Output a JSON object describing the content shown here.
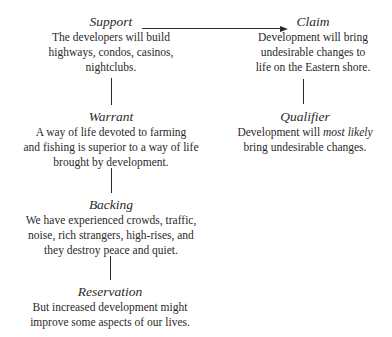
{
  "diagram": {
    "type": "toulmin-argument-model",
    "nodes": {
      "support": {
        "title": "Support",
        "lines": [
          "The developers will build",
          "highways, condos, casinos,",
          "nightclubs."
        ]
      },
      "claim": {
        "title": "Claim",
        "lines": [
          "Development will bring",
          "undesirable changes to",
          "life on the Eastern shore."
        ]
      },
      "warrant": {
        "title": "Warrant",
        "lines": [
          "A way of life devoted to farming",
          "and fishing is superior to a way of life",
          "brought by development."
        ]
      },
      "qualifier": {
        "title": "Qualifier",
        "line1_pre": "Development will ",
        "line1_emph": "most likely",
        "line2": "bring undesirable changes."
      },
      "backing": {
        "title": "Backing",
        "lines": [
          "We have experienced crowds, traffic,",
          "noise, rich strangers, high-rises, and",
          "they destroy peace and quiet."
        ]
      },
      "reservation": {
        "title": "Reservation",
        "lines": [
          "But increased development might",
          "improve some aspects of our lives."
        ]
      }
    },
    "edges": [
      {
        "from": "support",
        "to": "claim",
        "style": "arrow"
      },
      {
        "from": "support",
        "to": "warrant",
        "style": "line"
      },
      {
        "from": "warrant",
        "to": "backing",
        "style": "line"
      },
      {
        "from": "backing",
        "to": "reservation",
        "style": "line"
      },
      {
        "from": "claim",
        "to": "qualifier",
        "style": "line"
      }
    ]
  }
}
